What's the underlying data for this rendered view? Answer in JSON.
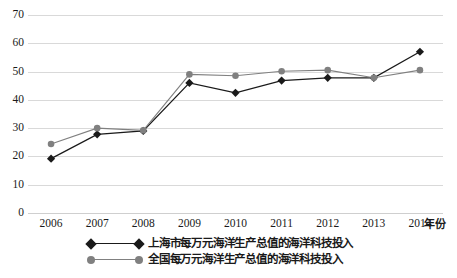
{
  "chart_data": {
    "type": "line",
    "title": "",
    "xlabel": "年份",
    "ylabel": "",
    "categories": [
      "2006",
      "2007",
      "2008",
      "2009",
      "2010",
      "2011",
      "2012",
      "2013",
      "2014"
    ],
    "x": [
      2006,
      2007,
      2008,
      2009,
      2010,
      2011,
      2012,
      2013,
      2014
    ],
    "ylim": [
      0,
      70
    ],
    "y_ticks": [
      "0",
      "10",
      "20",
      "30",
      "40",
      "50",
      "60",
      "70"
    ],
    "y_tick_values": [
      0,
      10,
      20,
      30,
      40,
      50,
      60,
      70
    ],
    "grid": true,
    "legend_position": "bottom",
    "series": [
      {
        "name": "上海市每万元海洋生产总值的海洋科技投入",
        "marker": "diamond",
        "color": "#1a1a1a",
        "values": [
          19.2,
          27.8,
          29.0,
          46.0,
          42.5,
          46.8,
          47.8,
          47.8,
          57.0
        ]
      },
      {
        "name": "全国每万元海洋生产总值的海洋科技投入",
        "marker": "circle",
        "color": "#808080",
        "values": [
          24.4,
          30.0,
          29.2,
          49.0,
          48.5,
          50.1,
          50.5,
          47.8,
          50.5
        ]
      }
    ]
  },
  "axes": {
    "x_axis_title": "年份",
    "gridline_color": "#d9d9d9",
    "baseline_color": "#cfcfcf"
  },
  "legend": {
    "items": [
      {
        "label": "上海市每万元海洋生产总值的海洋科技投入",
        "color": "#1a1a1a",
        "marker": "diamond"
      },
      {
        "label": "全国每万元海洋生产总值的海洋科技投入",
        "color": "#808080",
        "marker": "circle"
      }
    ]
  }
}
